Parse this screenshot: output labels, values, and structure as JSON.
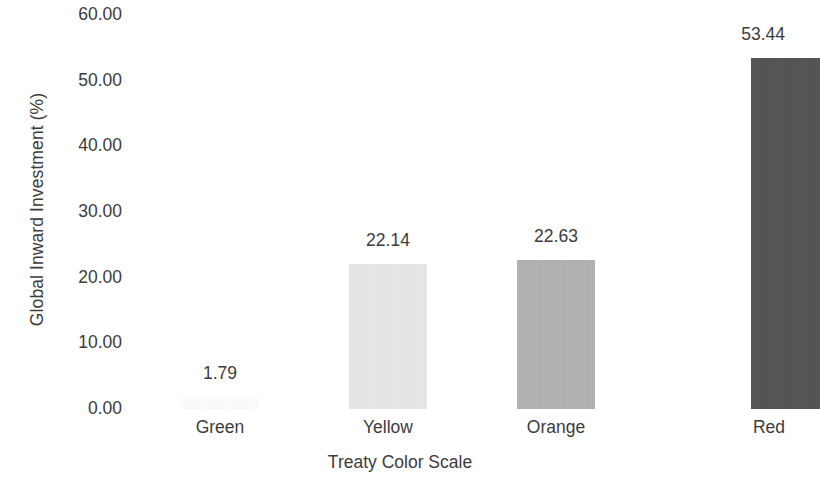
{
  "chart_data": {
    "type": "bar",
    "title": "",
    "xlabel": "Treaty Color Scale",
    "ylabel": "Global Inward Investment (%)",
    "categories": [
      "Green",
      "Yellow",
      "Orange",
      "Red"
    ],
    "values": [
      1.79,
      22.14,
      22.63,
      53.44
    ],
    "value_labels": [
      "1.79",
      "22.14",
      "22.63",
      "53.44"
    ],
    "bar_colors": [
      "#fdfdfd",
      "#e8e8e8",
      "#b3b3b3",
      "#565656"
    ],
    "ylim": [
      0,
      60
    ],
    "ytick_values": [
      0,
      10,
      20,
      30,
      40,
      50,
      60
    ],
    "ytick_labels": [
      "0.00",
      "10.00",
      "20.00",
      "30.00",
      "40.00",
      "50.00",
      "60.00"
    ],
    "grid": false,
    "legend": "none",
    "axis_text_color": "#3c3c3c",
    "background_color": "#ffffff",
    "note_last_bar_clipped": true
  },
  "axes": {
    "y_title": "Global Inward Investment (%)",
    "x_title": "Treaty Color Scale"
  }
}
